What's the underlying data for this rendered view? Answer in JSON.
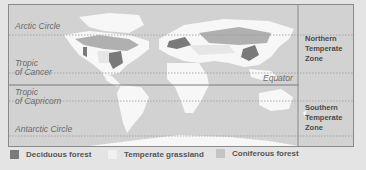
{
  "latitude_lines": {
    "arctic_circle": "Arctic Circle",
    "tropic_of_cancer": "Tropic\nof Cancer",
    "tropic_of_cancer_l1": "Tropic",
    "tropic_of_cancer_l2": "of Cancer",
    "equator": "Equator",
    "tropic_of_capricorn_l1": "Tropic",
    "tropic_of_capricorn_l2": "of Capricorn",
    "antarctic_circle": "Antarctic Circle"
  },
  "zones": {
    "northern": [
      "Northern",
      "Temperate",
      "Zone"
    ],
    "southern": [
      "Southern",
      "Temperate",
      "Zone"
    ]
  },
  "legend": [
    {
      "label": "Deciduous forest",
      "color": "#7a7a7a"
    },
    {
      "label": "Temperate grassland",
      "color": "#f0f0f0"
    },
    {
      "label": "Coniferous forest",
      "color": "#b4b4b4"
    }
  ],
  "colors": {
    "ocean": "#d2d2d2",
    "land": "#f7f7f7",
    "deciduous": "#7a7a7a",
    "coniferous": "#b0b0b0",
    "grassland": "#ebebeb"
  }
}
